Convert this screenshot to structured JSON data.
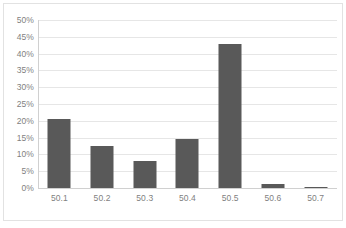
{
  "chart_data": {
    "type": "bar",
    "title": "",
    "subtitle": "",
    "xlabel": "",
    "ylabel": "",
    "categories": [
      "50.1",
      "50.2",
      "50.3",
      "50.4",
      "50.5",
      "50.6",
      "50.7"
    ],
    "values": [
      20.5,
      12.5,
      8.0,
      14.7,
      43.0,
      1.3,
      0.3
    ],
    "value_labels": [
      "20.5%",
      "12.5%",
      "8.0%",
      "14.7%",
      "43.0%",
      "1.3%",
      "0.3%"
    ],
    "series": [
      {
        "name": "",
        "values": [
          20.5,
          12.5,
          8.0,
          14.7,
          43.0,
          1.3,
          0.3
        ]
      }
    ],
    "ylim": [
      0,
      50
    ],
    "ytick_values": [
      0,
      5,
      10,
      15,
      20,
      25,
      30,
      35,
      40,
      45,
      50
    ],
    "ytick_labels": [
      "0%",
      "5%",
      "10%",
      "15%",
      "20%",
      "25%",
      "30%",
      "35%",
      "40%",
      "45%",
      "50%"
    ],
    "xtick_labels": [
      "50.1",
      "50.2",
      "50.3",
      "50.4",
      "50.5",
      "50.6",
      "50.7"
    ],
    "grid": true,
    "grid_axis": "y",
    "legend": false,
    "legend_position": "none",
    "bar_color": "#595959",
    "gridline_color": "#e6e6e6",
    "axis_color": "#d0d0d0",
    "tick_label_color": "#7f7f7f",
    "plot_background": "#ffffff",
    "annotations": []
  }
}
